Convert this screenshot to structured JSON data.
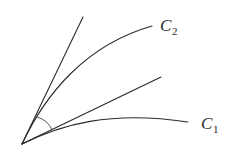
{
  "diagram": {
    "curves": [
      {
        "id": "C2",
        "label": "C",
        "subscript": "2"
      },
      {
        "id": "C1",
        "label": "C",
        "subscript": "1"
      }
    ],
    "tangent_lines": [
      {
        "id": "tangent-C2"
      },
      {
        "id": "tangent-C1"
      }
    ],
    "angle_marker": {
      "between": [
        "tangent-C2",
        "tangent-C1"
      ]
    },
    "colors": {
      "stroke": "#2a2a2a",
      "background": "#ffffff"
    }
  }
}
